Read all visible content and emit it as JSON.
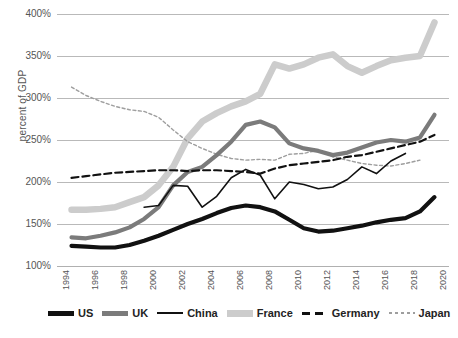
{
  "chart_data": {
    "type": "line",
    "title": "",
    "xlabel": "",
    "ylabel": "percent of GDP",
    "ylim": [
      100,
      400
    ],
    "ytick_step": 50,
    "ytick_labels": [
      "400%",
      "350%",
      "300%",
      "250%",
      "200%",
      "150%",
      "100%"
    ],
    "ytick_values": [
      400,
      350,
      300,
      250,
      200,
      150,
      100
    ],
    "xlim": [
      1994,
      2021
    ],
    "xtick_labels": [
      "1994",
      "1996",
      "1998",
      "2000",
      "2002",
      "2004",
      "2006",
      "2008",
      "2010",
      "2012",
      "2014",
      "2016",
      "2018",
      "2020"
    ],
    "xtick_values": [
      1994,
      1996,
      1998,
      2000,
      2002,
      2004,
      2006,
      2008,
      2010,
      2012,
      2014,
      2016,
      2018,
      2020
    ],
    "grid": true,
    "legend_position": "bottom",
    "x": [
      1995,
      1996,
      1997,
      1998,
      1999,
      2000,
      2001,
      2002,
      2003,
      2004,
      2005,
      2006,
      2007,
      2008,
      2009,
      2010,
      2011,
      2012,
      2013,
      2014,
      2015,
      2016,
      2017,
      2018,
      2019,
      2020
    ],
    "series": [
      {
        "name": "US",
        "color": "#111111",
        "style": "solid-thick",
        "values": [
          124,
          123,
          122,
          122,
          125,
          130,
          136,
          143,
          150,
          156,
          163,
          169,
          172,
          170,
          165,
          155,
          145,
          141,
          142,
          145,
          148,
          152,
          155,
          157,
          165,
          182
        ]
      },
      {
        "name": "UK",
        "color": "#7b7b7b",
        "style": "solid-thick",
        "values": [
          134,
          133,
          136,
          140,
          146,
          156,
          170,
          196,
          212,
          218,
          232,
          248,
          268,
          272,
          265,
          246,
          240,
          237,
          232,
          235,
          241,
          247,
          250,
          248,
          253,
          280
        ]
      },
      {
        "name": "China",
        "color": "#111111",
        "style": "solid-thin",
        "values": [
          null,
          null,
          null,
          null,
          null,
          170,
          172,
          196,
          195,
          170,
          183,
          205,
          215,
          208,
          180,
          200,
          197,
          192,
          194,
          203,
          218,
          210,
          225,
          234,
          null,
          null
        ]
      },
      {
        "name": "France",
        "color": "#cccccc",
        "style": "solid-xthick",
        "values": [
          167,
          167,
          168,
          170,
          176,
          182,
          196,
          218,
          252,
          272,
          282,
          290,
          296,
          305,
          340,
          335,
          340,
          348,
          352,
          338,
          330,
          338,
          345,
          348,
          350,
          390
        ]
      },
      {
        "name": "Germany",
        "color": "#111111",
        "style": "dashed",
        "values": [
          205,
          207,
          209,
          211,
          212,
          213,
          214,
          214,
          213,
          214,
          214,
          213,
          212,
          210,
          216,
          220,
          222,
          224,
          226,
          230,
          232,
          236,
          240,
          244,
          248,
          256
        ]
      },
      {
        "name": "Japan",
        "color": "#9e9e9e",
        "style": "dotted",
        "values": [
          313,
          303,
          296,
          290,
          286,
          284,
          277,
          262,
          248,
          240,
          233,
          228,
          226,
          227,
          226,
          233,
          234,
          238,
          230,
          226,
          222,
          220,
          219,
          222,
          226,
          null
        ]
      }
    ]
  },
  "legend": {
    "items": [
      {
        "label": "US",
        "color": "#111111",
        "style": "solid-thick"
      },
      {
        "label": "UK",
        "color": "#7b7b7b",
        "style": "solid-thick"
      },
      {
        "label": "China",
        "color": "#111111",
        "style": "solid-thin"
      },
      {
        "label": "France",
        "color": "#cccccc",
        "style": "solid-xthick"
      },
      {
        "label": "Germany",
        "color": "#111111",
        "style": "dashed"
      },
      {
        "label": "Japan",
        "color": "#9e9e9e",
        "style": "dotted"
      }
    ]
  },
  "source_note": ""
}
